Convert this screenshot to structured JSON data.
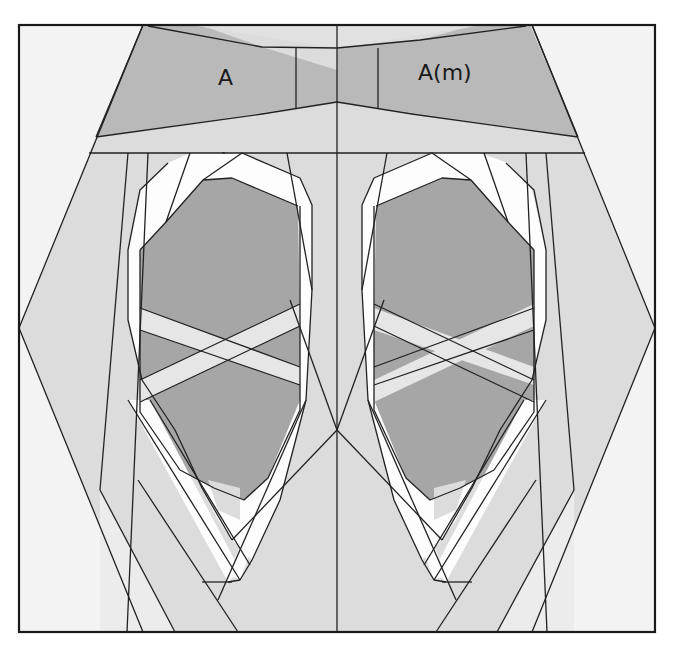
{
  "diagram": {
    "type": "paper-piecing quilt block pattern",
    "labels": {
      "left_section": "A",
      "right_section": "A(m)"
    },
    "colors": {
      "background": "#f3f3f3",
      "light_gray": "#dcdcdc",
      "medium_gray": "#b9b9b9",
      "dark_gray": "#a6a6a6",
      "white_ribbon": "#fdfdfd",
      "outline": "#222222"
    }
  }
}
